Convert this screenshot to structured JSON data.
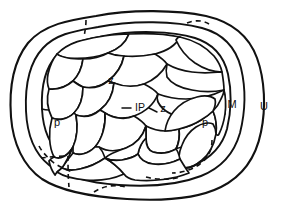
{
  "figure": {
    "background_color": "#ffffff",
    "line_color": "#111111",
    "width": 281,
    "height": 204
  },
  "labels": {
    "outer_u": "U",
    "margin_m": "M",
    "upper_z": "z",
    "inner_ip": "IP",
    "inner_z": "z",
    "left_p": "p",
    "right_p": "p"
  },
  "regions": {
    "outer_boundary_name": "outer-rim",
    "margin_band_name": "margin-band",
    "inner_field_name": "inner-cell-field"
  }
}
